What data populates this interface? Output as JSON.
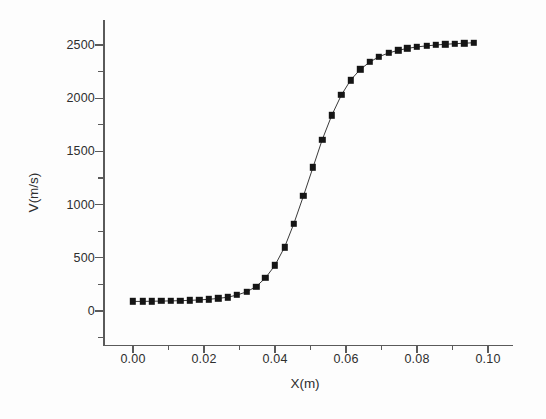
{
  "figure": {
    "background": "#fdfdfd",
    "axis_color": "#5a5a5a",
    "marker_color": "#151515",
    "line_color": "#3a3a3a"
  },
  "chart_data": {
    "type": "line",
    "title": "",
    "xlabel": "X(m)",
    "ylabel": "V(m/s)",
    "xlim": [
      -0.005,
      0.1085
    ],
    "ylim": [
      -330,
      2690
    ],
    "grid": false,
    "legend": null,
    "marker": "filled-square",
    "xticks": [
      0.0,
      0.02,
      0.04,
      0.06,
      0.08,
      0.1
    ],
    "xticklabels": [
      "0.00",
      "0.02",
      "0.04",
      "0.06",
      "0.08",
      "0.10"
    ],
    "xminorticks": [
      0.01,
      0.03,
      0.05,
      0.07,
      0.09
    ],
    "yticks": [
      0,
      500,
      1000,
      1500,
      2000,
      2500
    ],
    "yticklabels": [
      "0",
      "500",
      "1000",
      "1500",
      "2000",
      "2500"
    ],
    "yminorticks": [
      -250,
      250,
      750,
      1250,
      1750,
      2250
    ],
    "x": [
      0.0,
      0.0027,
      0.0053,
      0.008,
      0.0107,
      0.0133,
      0.016,
      0.0187,
      0.0213,
      0.024,
      0.0267,
      0.0293,
      0.032,
      0.0347,
      0.0373,
      0.04,
      0.0427,
      0.0453,
      0.048,
      0.0507,
      0.0533,
      0.056,
      0.0587,
      0.0613,
      0.064,
      0.0667,
      0.0693,
      0.072,
      0.0747,
      0.0773,
      0.08,
      0.0827,
      0.0853,
      0.088,
      0.0907,
      0.0933,
      0.096
    ],
    "y": [
      90,
      90,
      92,
      93,
      95,
      97,
      100,
      104,
      110,
      118,
      130,
      150,
      180,
      230,
      310,
      430,
      600,
      820,
      1080,
      1350,
      1610,
      1840,
      2030,
      2170,
      2270,
      2340,
      2390,
      2425,
      2450,
      2468,
      2482,
      2492,
      2500,
      2507,
      2512,
      2517,
      2521
    ],
    "series": [
      {
        "name": "V",
        "values": [
          90,
          90,
          92,
          93,
          95,
          97,
          100,
          104,
          110,
          118,
          130,
          150,
          180,
          230,
          310,
          430,
          600,
          820,
          1080,
          1350,
          1610,
          1840,
          2030,
          2170,
          2270,
          2340,
          2390,
          2425,
          2450,
          2468,
          2482,
          2492,
          2500,
          2507,
          2512,
          2517,
          2521
        ]
      }
    ]
  }
}
